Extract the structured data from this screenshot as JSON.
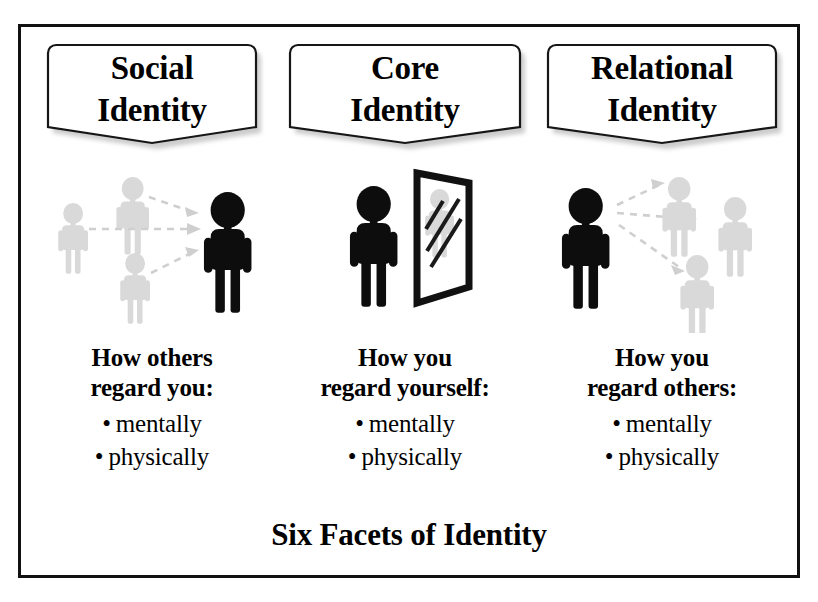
{
  "diagram": {
    "title": "Six Facets of Identity",
    "background_color": "#ffffff",
    "frame_color": "#111111",
    "figure_dark_color": "#0d0d0d",
    "figure_light_color": "#d9d9d9",
    "arrow_color": "#cfcfcf",
    "columns": [
      {
        "id": "social",
        "banner_label": "Social\nIdentity",
        "artwork_name": "others-regarding-you-pictogram",
        "artwork_description": "Three light gray figures with dashed arrows pointing toward one dark figure on the right",
        "caption_heading": "How others\nregard you:",
        "bullets": [
          "mentally",
          "physically"
        ]
      },
      {
        "id": "core",
        "banner_label": "Core\nIdentity",
        "artwork_name": "self-mirror-pictogram",
        "artwork_description": "A dark figure standing beside a tilted mirror showing a light gray reflection",
        "caption_heading": "How you\nregard yourself:",
        "bullets": [
          "mentally",
          "physically"
        ]
      },
      {
        "id": "relational",
        "banner_label": "Relational\nIdentity",
        "artwork_name": "you-regarding-others-pictogram",
        "artwork_description": "One dark figure on the left with dashed arrows pointing out to three light gray figures",
        "caption_heading": "How you\nregard others:",
        "bullets": [
          "mentally",
          "physically"
        ]
      }
    ],
    "bullet_glyph": "•"
  }
}
